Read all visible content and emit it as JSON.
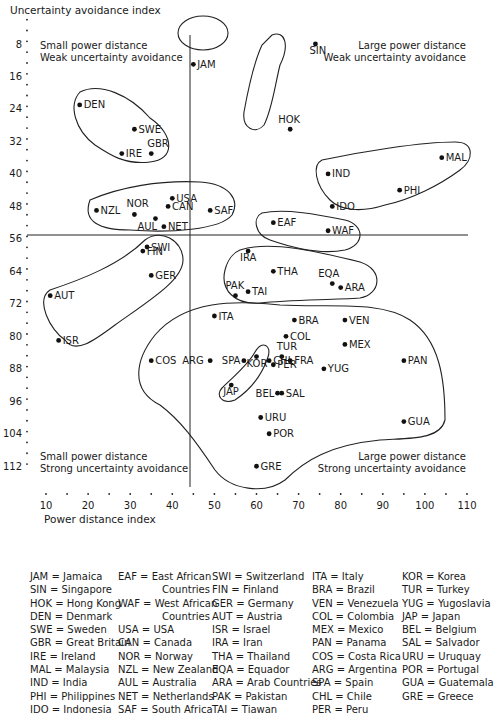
{
  "chart_data": {
    "type": "scatter",
    "title": "",
    "xlabel": "Power distance index",
    "ylabel": "Uncertainty avoidance index",
    "xlim": [
      10,
      110
    ],
    "ylim": [
      8,
      112
    ],
    "y_inverted": true,
    "x_ticks": [
      10,
      20,
      30,
      40,
      50,
      60,
      70,
      80,
      90,
      100,
      110
    ],
    "y_ticks": [
      8,
      16,
      24,
      32,
      40,
      48,
      56,
      64,
      72,
      80,
      88,
      96,
      104,
      112
    ],
    "divider_x": 44,
    "divider_y": 55,
    "quadrant_labels": {
      "top_left": [
        "Small power distance",
        "Weak uncertainty avoidance"
      ],
      "top_right": [
        "Large power distance",
        "Weak uncertainty avoidance"
      ],
      "bottom_left": [
        "Small power distance",
        "Strong uncertainty avoidance"
      ],
      "bottom_right": [
        "Large power distance",
        "Strong uncertainty avoidance"
      ]
    },
    "points": [
      {
        "code": "JAM",
        "x": 45,
        "y": 13
      },
      {
        "code": "SIN",
        "x": 74,
        "y": 8
      },
      {
        "code": "HOK",
        "x": 68,
        "y": 29
      },
      {
        "code": "DEN",
        "x": 18,
        "y": 23
      },
      {
        "code": "SWE",
        "x": 31,
        "y": 29
      },
      {
        "code": "GBR",
        "x": 35,
        "y": 35
      },
      {
        "code": "IRE",
        "x": 28,
        "y": 35
      },
      {
        "code": "MAL",
        "x": 104,
        "y": 36
      },
      {
        "code": "IND",
        "x": 77,
        "y": 40
      },
      {
        "code": "PHI",
        "x": 94,
        "y": 44
      },
      {
        "code": "IDO",
        "x": 78,
        "y": 48
      },
      {
        "code": "USA",
        "x": 40,
        "y": 46
      },
      {
        "code": "CAN",
        "x": 39,
        "y": 48
      },
      {
        "code": "NZL",
        "x": 22,
        "y": 49
      },
      {
        "code": "NOR",
        "x": 31,
        "y": 50
      },
      {
        "code": "AUL",
        "x": 36,
        "y": 51
      },
      {
        "code": "NET",
        "x": 38,
        "y": 53
      },
      {
        "code": "SAF",
        "x": 49,
        "y": 49
      },
      {
        "code": "EAF",
        "x": 64,
        "y": 52
      },
      {
        "code": "WAF",
        "x": 77,
        "y": 54
      },
      {
        "code": "SWI",
        "x": 34,
        "y": 58
      },
      {
        "code": "FIN",
        "x": 33,
        "y": 59
      },
      {
        "code": "GER",
        "x": 35,
        "y": 65
      },
      {
        "code": "AUT",
        "x": 11,
        "y": 70
      },
      {
        "code": "ISR",
        "x": 13,
        "y": 81
      },
      {
        "code": "IRA",
        "x": 58,
        "y": 59
      },
      {
        "code": "THA",
        "x": 64,
        "y": 64
      },
      {
        "code": "EQA",
        "x": 78,
        "y": 67
      },
      {
        "code": "ARA",
        "x": 80,
        "y": 68
      },
      {
        "code": "PAK",
        "x": 55,
        "y": 70
      },
      {
        "code": "TAI",
        "x": 58,
        "y": 69
      },
      {
        "code": "ITA",
        "x": 50,
        "y": 75
      },
      {
        "code": "BRA",
        "x": 69,
        "y": 76
      },
      {
        "code": "VEN",
        "x": 81,
        "y": 76
      },
      {
        "code": "COL",
        "x": 67,
        "y": 80
      },
      {
        "code": "MEX",
        "x": 81,
        "y": 82
      },
      {
        "code": "TUR",
        "x": 66,
        "y": 85
      },
      {
        "code": "FRA",
        "x": 68,
        "y": 86
      },
      {
        "code": "CHL",
        "x": 63,
        "y": 86
      },
      {
        "code": "KOR",
        "x": 60,
        "y": 85
      },
      {
        "code": "PER",
        "x": 64,
        "y": 87
      },
      {
        "code": "SPA",
        "x": 57,
        "y": 86
      },
      {
        "code": "ARG",
        "x": 49,
        "y": 86
      },
      {
        "code": "COS",
        "x": 35,
        "y": 86
      },
      {
        "code": "YUG",
        "x": 76,
        "y": 88
      },
      {
        "code": "PAN",
        "x": 95,
        "y": 86
      },
      {
        "code": "JAP",
        "x": 54,
        "y": 92
      },
      {
        "code": "BEL",
        "x": 65,
        "y": 94
      },
      {
        "code": "SAL",
        "x": 66,
        "y": 94
      },
      {
        "code": "URU",
        "x": 61,
        "y": 100
      },
      {
        "code": "POR",
        "x": 63,
        "y": 104
      },
      {
        "code": "GUA",
        "x": 95,
        "y": 101
      },
      {
        "code": "GRE",
        "x": 60,
        "y": 112
      }
    ]
  },
  "legend": {
    "columns": [
      [
        "JAM = Jamaica",
        "SIN = Singapore",
        "HOK = Hong Kong",
        "DEN = Denmark",
        "SWE = Sweden",
        "GBR = Great Britain",
        "IRE = Ireland",
        "MAL = Malaysia",
        "IND = India",
        "PHI = Philippines",
        "IDO = Indonesia"
      ],
      [
        "EAF = East African",
        "Countries",
        "WAF = West African",
        "Countries",
        "USA = USA",
        "CAN = Canada",
        "NOR = Norway",
        "NZL = New Zealand",
        "AUL = Australia",
        "NET = Netherlands",
        "SAF = South Africa"
      ],
      [
        "SWI = Switzerland",
        "FIN = Finland",
        "GER = Germany",
        "AUT = Austria",
        "ISR = Israel",
        "IRA = Iran",
        "THA = Thailand",
        "EQA = Equador",
        "ARA = Arab Countries",
        "PAK = Pakistan",
        "TAI = Tiawan"
      ],
      [
        "ITA = Italy",
        "BRA = Brazil",
        "VEN = Venezuela",
        "COL = Colombia",
        "MEX = Mexico",
        "PAN = Panama",
        "COS = Costa Rica",
        "ARG = Argentina",
        "SPA = Spain",
        "CHL = Chile",
        "PER = Peru"
      ],
      [
        "KOR = Korea",
        "TUR = Turkey",
        "YUG = Yugoslavia",
        "JAP = Japan",
        "BEL = Belgium",
        "SAL = Salvador",
        "URU = Uruquay",
        "POR = Portugal",
        "GUA = Guatemala",
        "GRE = Greece"
      ]
    ]
  }
}
